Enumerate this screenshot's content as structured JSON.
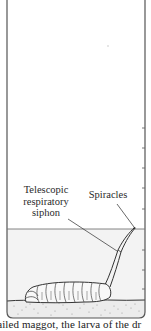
{
  "diagram": {
    "labels": {
      "siphon": [
        "Telescopic",
        "respiratory",
        "siphon"
      ],
      "spiracles": "Spiracles"
    },
    "caption": "tailed maggot, the larva of the dr",
    "water_line_y": 229,
    "tick_marks_y": [
      128,
      148,
      168,
      188,
      209,
      250,
      270,
      289
    ],
    "colors": {
      "outline": "#555555",
      "water": "#f4f4f4",
      "sand_dots": "#8a8a8a",
      "ink": "#2a2a2a"
    }
  }
}
